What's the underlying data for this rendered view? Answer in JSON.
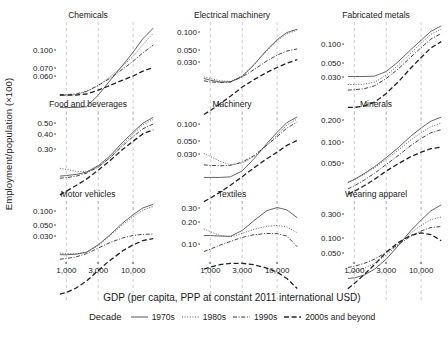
{
  "chart_data": {
    "type": "line",
    "title": "",
    "xlabel": "GDP (per capita, PPP at constant 2011 international USD)",
    "ylabel": "Employment/population (×100)",
    "xscale": "log",
    "yscale": "log",
    "xlim": [
      700,
      22000
    ],
    "xticks": [
      1000,
      3000,
      10000
    ],
    "xticklabels": [
      "1,000",
      "3,000",
      "10,000"
    ],
    "grid": "vertical dashed gridlines at x ticks",
    "legend": {
      "position": "bottom",
      "title": "Decade",
      "entries": [
        {
          "name": "1970s",
          "dash": "solid"
        },
        {
          "name": "1980s",
          "dash": "dotted"
        },
        {
          "name": "1990s",
          "dash": "dash-dot"
        },
        {
          "name": "2000s and beyond",
          "dash": "long-dash"
        }
      ]
    },
    "series_names": [
      "1970s",
      "1980s",
      "1990s",
      "2000s and beyond"
    ],
    "x": [
      800,
      1000,
      1400,
      2000,
      3000,
      4500,
      7000,
      10000,
      14000,
      20000
    ],
    "panels": [
      {
        "title": "Chemicals",
        "yticks": [
          0.1,
          0.07,
          0.06
        ],
        "yticklabels": [
          "0.100",
          "0.070",
          "0.060"
        ],
        "ylim": [
          0.05,
          0.175
        ],
        "series": [
          {
            "name": "1970s",
            "values": [
              0.06,
              0.06,
              0.06,
              0.0605,
              0.07,
              0.084,
              0.102,
              0.12,
              0.142,
              0.162
            ]
          },
          {
            "name": "1980s",
            "values": [
              0.07,
              0.07,
              0.0705,
              0.073,
              0.079,
              0.088,
              0.101,
              0.114,
              0.132,
              0.152
            ]
          },
          {
            "name": "1990s",
            "values": [
              0.0705,
              0.0705,
              0.071,
              0.0735,
              0.079,
              0.0865,
              0.097,
              0.107,
              0.119,
              0.131
            ]
          },
          {
            "name": "2000s and beyond",
            "values": [
              0.07,
              0.07,
              0.07,
              0.071,
              0.0745,
              0.079,
              0.0845,
              0.089,
              0.0945,
              0.099
            ]
          }
        ]
      },
      {
        "title": "Electrical machinery",
        "yticks": [
          0.1,
          0.05,
          0.03
        ],
        "yticklabels": [
          "0.100",
          "0.050",
          "0.030"
        ],
        "ylim": [
          0.012,
          0.15
        ],
        "series": [
          {
            "name": "1970s",
            "values": [
              0.036,
              0.0345,
              0.033,
              0.033,
              0.038,
              0.051,
              0.074,
              0.096,
              0.115,
              0.125
            ]
          },
          {
            "name": "1980s",
            "values": [
              0.0375,
              0.036,
              0.034,
              0.0335,
              0.0385,
              0.051,
              0.072,
              0.093,
              0.111,
              0.122
            ]
          },
          {
            "name": "1990s",
            "values": [
              0.034,
              0.033,
              0.0325,
              0.033,
              0.0375,
              0.045,
              0.056,
              0.065,
              0.072,
              0.076
            ]
          },
          {
            "name": "2000s and beyond",
            "values": [
              0.0145,
              0.016,
              0.019,
              0.023,
              0.029,
              0.035,
              0.042,
              0.0475,
              0.053,
              0.058
            ]
          }
        ]
      },
      {
        "title": "Fabricated metals",
        "yticks": [
          0.1,
          0.05,
          0.03
        ],
        "yticklabels": [
          "0.100",
          "0.050",
          "0.030"
        ],
        "ylim": [
          0.022,
          0.23
        ],
        "series": [
          {
            "name": "1970s",
            "values": [
              0.064,
              0.064,
              0.064,
              0.0645,
              0.072,
              0.09,
              0.12,
              0.15,
              0.185,
              0.21
            ]
          },
          {
            "name": "1980s",
            "values": [
              0.053,
              0.053,
              0.0535,
              0.056,
              0.066,
              0.083,
              0.111,
              0.14,
              0.172,
              0.195
            ]
          },
          {
            "name": "1990s",
            "values": [
              0.0465,
              0.047,
              0.048,
              0.0515,
              0.061,
              0.076,
              0.101,
              0.126,
              0.154,
              0.176
            ]
          },
          {
            "name": "2000s and beyond",
            "values": [
              0.031,
              0.031,
              0.032,
              0.035,
              0.043,
              0.056,
              0.078,
              0.1,
              0.125,
              0.145
            ]
          }
        ]
      },
      {
        "title": "Food and beverages",
        "yticks": [
          0.5,
          0.4,
          0.3
        ],
        "yticklabels": [
          "0.50",
          "0.40",
          "0.30"
        ],
        "ylim": [
          0.185,
          0.62
        ],
        "series": [
          {
            "name": "1970s",
            "values": [
              0.282,
              0.284,
              0.288,
              0.296,
              0.32,
              0.36,
              0.425,
              0.48,
              0.535,
              0.575
            ]
          },
          {
            "name": "1980s",
            "values": [
              0.31,
              0.306,
              0.299,
              0.297,
              0.315,
              0.352,
              0.415,
              0.47,
              0.525,
              0.56
            ]
          },
          {
            "name": "1990s",
            "values": [
              0.275,
              0.277,
              0.282,
              0.292,
              0.315,
              0.352,
              0.408,
              0.455,
              0.5,
              0.53
            ]
          },
          {
            "name": "2000s and beyond",
            "values": [
              0.225,
              0.235,
              0.252,
              0.272,
              0.303,
              0.34,
              0.39,
              0.43,
              0.47,
              0.495
            ]
          }
        ]
      },
      {
        "title": "Machinery",
        "yticks": [
          0.1,
          0.05,
          0.03
        ],
        "yticklabels": [
          "0.100",
          "0.050",
          "0.030"
        ],
        "ylim": [
          0.013,
          0.165
        ],
        "series": [
          {
            "name": "1970s",
            "values": [
              0.0305,
              0.0305,
              0.0305,
              0.031,
              0.036,
              0.049,
              0.072,
              0.096,
              0.123,
              0.142
            ]
          },
          {
            "name": "1980s",
            "values": [
              0.056,
              0.052,
              0.046,
              0.042,
              0.044,
              0.052,
              0.07,
              0.09,
              0.115,
              0.135
            ]
          },
          {
            "name": "1990s",
            "values": [
              0.042,
              0.0415,
              0.041,
              0.0415,
              0.045,
              0.053,
              0.069,
              0.086,
              0.107,
              0.125
            ]
          },
          {
            "name": "2000s and beyond",
            "values": [
              0.0165,
              0.018,
              0.021,
              0.025,
              0.031,
              0.039,
              0.049,
              0.058,
              0.069,
              0.078
            ]
          }
        ]
      },
      {
        "title": "Minerals",
        "yticks": [
          0.2,
          0.1,
          0.05
        ],
        "yticklabels": [
          "0.200",
          "0.100",
          "0.050"
        ],
        "ylim": [
          0.035,
          0.26
        ],
        "series": [
          {
            "name": "1970s",
            "values": [
              0.062,
              0.066,
              0.074,
              0.085,
              0.102,
              0.124,
              0.157,
              0.185,
              0.212,
              0.23
            ]
          },
          {
            "name": "1980s",
            "values": [
              0.062,
              0.0655,
              0.073,
              0.083,
              0.099,
              0.118,
              0.145,
              0.168,
              0.19,
              0.204
            ]
          },
          {
            "name": "1990s",
            "values": [
              0.0545,
              0.058,
              0.065,
              0.0745,
              0.089,
              0.106,
              0.13,
              0.15,
              0.168,
              0.179
            ]
          },
          {
            "name": "2000s and beyond",
            "values": [
              0.049,
              0.052,
              0.058,
              0.066,
              0.078,
              0.09,
              0.104,
              0.114,
              0.122,
              0.126
            ]
          }
        ]
      },
      {
        "title": "Motor vehicles",
        "yticks": [
          0.1,
          0.05,
          0.03
        ],
        "yticklabels": [
          "0.100",
          "0.050",
          "0.030"
        ],
        "ylim": [
          0.008,
          0.16
        ],
        "series": [
          {
            "name": "1970s",
            "values": [
              0.032,
              0.032,
              0.0325,
              0.0345,
              0.043,
              0.058,
              0.083,
              0.106,
              0.13,
              0.145
            ]
          },
          {
            "name": "1980s",
            "values": [
              0.0335,
              0.033,
              0.033,
              0.0345,
              0.042,
              0.056,
              0.079,
              0.1,
              0.122,
              0.136
            ]
          },
          {
            "name": "1990s",
            "values": [
              0.028,
              0.0285,
              0.03,
              0.033,
              0.039,
              0.046,
              0.053,
              0.057,
              0.059,
              0.0595
            ]
          },
          {
            "name": "2000s and beyond",
            "values": [
              0.0098,
              0.0103,
              0.0118,
              0.0145,
              0.02,
              0.027,
              0.036,
              0.043,
              0.049,
              0.052
            ]
          }
        ]
      },
      {
        "title": "Textiles",
        "yticks": [
          0.3,
          0.2,
          0.1
        ],
        "yticklabels": [
          "0.30",
          "0.20",
          "0.10"
        ],
        "ylim": [
          0.055,
          0.38
        ],
        "series": [
          {
            "name": "1970s",
            "values": [
              0.195,
              0.195,
              0.193,
              0.192,
              0.215,
              0.26,
              0.315,
              0.335,
              0.32,
              0.275
            ]
          },
          {
            "name": "1980s",
            "values": [
              0.222,
              0.21,
              0.195,
              0.19,
              0.203,
              0.22,
              0.233,
              0.237,
              0.23,
              0.206
            ]
          },
          {
            "name": "1990s",
            "values": [
              0.143,
              0.15,
              0.162,
              0.174,
              0.188,
              0.198,
              0.203,
              0.202,
              0.193,
              0.157
            ]
          },
          {
            "name": "2000s and beyond",
            "values": [
              0.102,
              0.106,
              0.111,
              0.114,
              0.114,
              0.111,
              0.104,
              0.096,
              0.085,
              0.07
            ]
          }
        ]
      },
      {
        "title": "Wearing apparel",
        "yticks": [
          0.3,
          0.1,
          0.05
        ],
        "yticklabels": [
          "0.300",
          "0.100",
          "0.050"
        ],
        "ylim": [
          0.03,
          0.56
        ],
        "series": [
          {
            "name": "1970s",
            "values": [
              0.058,
              0.059,
              0.064,
              0.076,
              0.102,
              0.15,
              0.235,
              0.32,
              0.42,
              0.5
            ]
          },
          {
            "name": "1980s",
            "values": [
              0.069,
              0.071,
              0.078,
              0.09,
              0.115,
              0.155,
              0.22,
              0.275,
              0.325,
              0.35
            ]
          },
          {
            "name": "1990s",
            "values": [
              0.08,
              0.083,
              0.09,
              0.102,
              0.124,
              0.156,
              0.2,
              0.233,
              0.258,
              0.265
            ]
          },
          {
            "name": "2000s and beyond",
            "values": [
              0.043,
              0.05,
              0.065,
              0.087,
              0.125,
              0.165,
              0.205,
              0.22,
              0.21,
              0.175
            ]
          }
        ]
      }
    ]
  }
}
